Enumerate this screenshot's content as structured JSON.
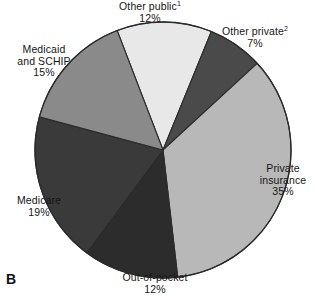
{
  "figure": {
    "panel_letter": "B",
    "background_color": "#ffffff"
  },
  "chart_data": {
    "type": "pie",
    "title": "",
    "subtitle": "",
    "xlabel": "",
    "ylabel": "",
    "legend_position": "none",
    "grid": false,
    "label_style": "outside-callout",
    "start_angle_deg": -21,
    "direction": "clockwise",
    "center": {
      "x": 163,
      "y": 150
    },
    "radius": 128,
    "units": "percent",
    "total": 100,
    "categories": [
      "Other public",
      "Other private",
      "Private insurance",
      "Out-of-pocket",
      "Medicare",
      "Medicaid and SCHIP"
    ],
    "values": [
      12,
      7,
      35,
      12,
      19,
      15
    ],
    "colors": [
      "#e8e8e8",
      "#4a4a4a",
      "#b8b8b8",
      "#2c2c2c",
      "#3a3a3a",
      "#8a8a8a"
    ],
    "slices": [
      {
        "name": "other-public",
        "label": "Other public",
        "footnote_marker": "1",
        "value": 12,
        "value_text": "12%",
        "color": "#e8e8e8",
        "stroke": "#2b2b2b"
      },
      {
        "name": "other-private",
        "label": "Other private",
        "footnote_marker": "2",
        "value": 7,
        "value_text": "7%",
        "color": "#4a4a4a",
        "stroke": "#2b2b2b"
      },
      {
        "name": "private-insurance",
        "label": "Private insurance",
        "label_line1": "Private",
        "label_line2": "insurance",
        "footnote_marker": "",
        "value": 35,
        "value_text": "35%",
        "color": "#b8b8b8",
        "stroke": "#2b2b2b"
      },
      {
        "name": "out-of-pocket",
        "label": "Out-of-pocket",
        "footnote_marker": "",
        "value": 12,
        "value_text": "12%",
        "color": "#2c2c2c",
        "stroke": "#2b2b2b"
      },
      {
        "name": "medicare",
        "label": "Medicare",
        "footnote_marker": "",
        "value": 19,
        "value_text": "19%",
        "color": "#3a3a3a",
        "stroke": "#2b2b2b"
      },
      {
        "name": "medicaid-schip",
        "label": "Medicaid and SCHIP",
        "label_line1": "Medicaid",
        "label_line2": "and SCHIP",
        "footnote_marker": "",
        "value": 15,
        "value_text": "15%",
        "color": "#8a8a8a",
        "stroke": "#2b2b2b"
      }
    ]
  }
}
